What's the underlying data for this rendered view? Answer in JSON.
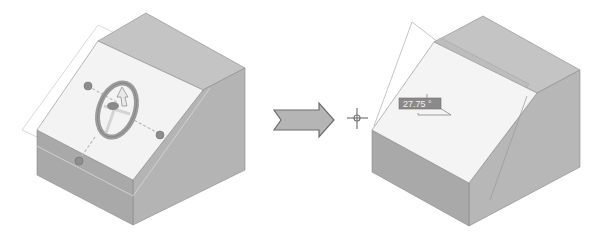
{
  "figure": {
    "before": {
      "label": "before-rotation",
      "manipulator": "steering-wheel"
    },
    "transition_icon": "right-arrow-icon",
    "cursor_icon": "crosshair-icon",
    "after": {
      "label": "after-rotation",
      "angle_readout": "27.75 °"
    }
  },
  "colors": {
    "background": "#ffffff",
    "top_face": "#c4c4c4",
    "slope_face": "#f3f3f3",
    "front_face": "#a9a9a9",
    "side_face": "#b7b7b7",
    "edge": "#8a8a8a",
    "plane_outline": "#c8c8c8",
    "wheel": "#9c9c9c",
    "handle": "#8e8e8e",
    "arrow_fill": "#b5b5b5",
    "arrow_stroke": "#6d6d6d",
    "readout_bg": "#8a8a8a"
  }
}
